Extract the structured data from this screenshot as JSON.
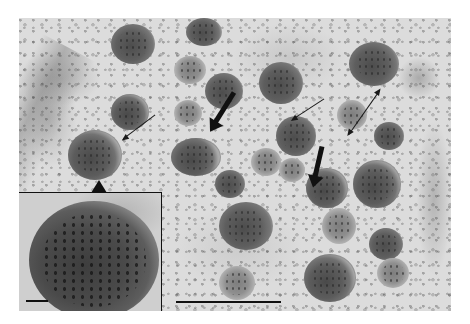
{
  "figure": {
    "type": "transmission electron micrograph",
    "colors": {
      "background": "#ffffff",
      "cytoplasm": "#dcdcdc",
      "vesicle_core": "#4d4d4d",
      "annotation": "#111111"
    }
  },
  "annotations": {
    "thin_arrows": 3,
    "bold_arrows": 2,
    "inset_pointer": "upward arrowhead pointing to enlarged vesicle",
    "scale_bars": [
      {
        "location": "main image, bottom center",
        "length_px": 105
      },
      {
        "location": "inset, bottom left",
        "length_px": 22
      }
    ]
  }
}
